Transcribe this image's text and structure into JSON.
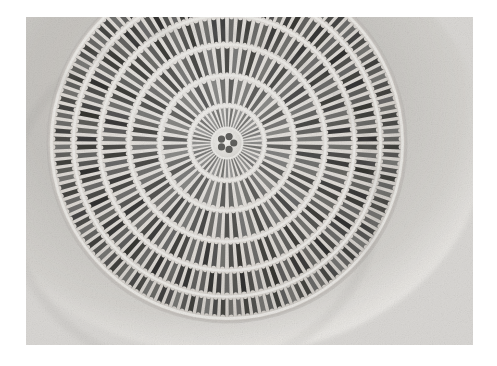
{
  "image": {
    "kind": "light-micrograph",
    "subject": "centric diatom frustule valve",
    "caption_text": "",
    "background_color": "#ffffff",
    "print_area": {
      "x": 26,
      "y": 17,
      "width": 447,
      "height": 328,
      "base_tone": "#d5d3d0",
      "corner_tone": "#efeeec"
    }
  },
  "specimen": {
    "center_x": 227,
    "center_y": 143,
    "outer_radius": 176,
    "outline_color": "#b9b7b3",
    "rib_color": "#ecebe8",
    "pore_color": "#3a3a38",
    "halo_color": "#c9c7c3",
    "central_rosette": {
      "radius": 13,
      "pore_count": 5,
      "hub_color": "#e8e7e4"
    },
    "rings": [
      {
        "name": "ring-1",
        "inner_radius": 15,
        "outer_radius": 36,
        "bar_count": 44,
        "bar_width_deg": 4.4,
        "darkness": 0.58
      },
      {
        "name": "ring-2",
        "inner_radius": 39,
        "outer_radius": 66,
        "bar_count": 44,
        "bar_width_deg": 4.6,
        "darkness": 0.68
      },
      {
        "name": "ring-3",
        "inner_radius": 69,
        "outer_radius": 97,
        "bar_count": 66,
        "bar_width_deg": 3.1,
        "darkness": 0.76
      },
      {
        "name": "ring-4",
        "inner_radius": 100,
        "outer_radius": 126,
        "bar_count": 88,
        "bar_width_deg": 2.3,
        "darkness": 0.82
      },
      {
        "name": "ring-5",
        "inner_radius": 129,
        "outer_radius": 152,
        "bar_count": 110,
        "bar_width_deg": 1.9,
        "darkness": 0.86
      },
      {
        "name": "ring-6",
        "inner_radius": 155,
        "outer_radius": 174,
        "bar_count": 132,
        "bar_width_deg": 1.6,
        "darkness": 0.8
      }
    ]
  },
  "tone_scale": {
    "lightest": "#f4f3f1",
    "light": "#dcdad7",
    "mid": "#a9a7a3",
    "dark": "#5e5d5a",
    "darkest": "#2e2e2c"
  }
}
